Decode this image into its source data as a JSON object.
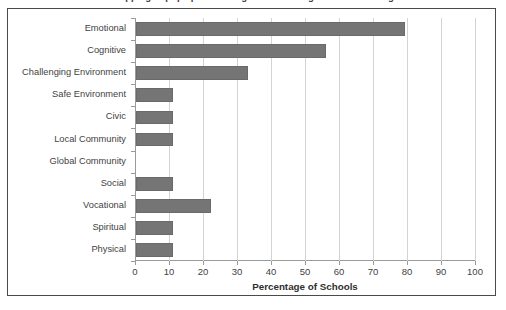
{
  "figure": {
    "clipped_top_title": "Mapping of pupil provision against the categories of wellbeing",
    "frame_border_color": "#4a4a4a",
    "background_color": "#ffffff"
  },
  "chart_data": {
    "type": "bar",
    "orientation": "horizontal",
    "title": "",
    "xlabel": "Percentage of Schools",
    "ylabel": "",
    "categories": [
      "Emotional",
      "Cognitive",
      "Challenging Environment",
      "Safe Environment",
      "Civic",
      "Local Community",
      "Global Community",
      "Social",
      "Vocational",
      "Spiritual",
      "Physical"
    ],
    "values": [
      79,
      56,
      33,
      11,
      11,
      11,
      0,
      11,
      22,
      11,
      11
    ],
    "xlim": [
      0,
      100
    ],
    "xticks": [
      0,
      10,
      20,
      30,
      40,
      50,
      60,
      70,
      80,
      90,
      100
    ],
    "xtick_labels": [
      "0",
      "10",
      "20",
      "30",
      "40",
      "50",
      "60",
      "70",
      "80",
      "90",
      "100"
    ],
    "grid": "vertical",
    "legend": "none",
    "bar_color": "#757575",
    "gridline_color": "#d3d3d3",
    "axis_color": "#9a9a9a",
    "text_color": "#3f3f3f"
  }
}
